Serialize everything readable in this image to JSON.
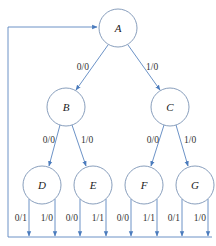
{
  "diagram": {
    "type": "state-transition-tree",
    "colors": {
      "line": "#5b86bf",
      "circle": "#7a93b4",
      "text": "#222222",
      "background": "#ffffff"
    },
    "nodes": [
      {
        "id": "A",
        "label": "A"
      },
      {
        "id": "B",
        "label": "B"
      },
      {
        "id": "C",
        "label": "C"
      },
      {
        "id": "D",
        "label": "D"
      },
      {
        "id": "E",
        "label": "E"
      },
      {
        "id": "F",
        "label": "F"
      },
      {
        "id": "G",
        "label": "G"
      }
    ],
    "edges": [
      {
        "from": "A",
        "to": "B",
        "label": "0/0"
      },
      {
        "from": "A",
        "to": "C",
        "label": "1/0"
      },
      {
        "from": "B",
        "to": "D",
        "label": "0/0"
      },
      {
        "from": "B",
        "to": "E",
        "label": "1/0"
      },
      {
        "from": "C",
        "to": "F",
        "label": "0/0"
      },
      {
        "from": "C",
        "to": "G",
        "label": "1/0"
      }
    ],
    "return_edges": [
      {
        "from": "D",
        "to": "A",
        "label": "0/1"
      },
      {
        "from": "D",
        "to": "A",
        "label": "1/0"
      },
      {
        "from": "E",
        "to": "A",
        "label": "0/0"
      },
      {
        "from": "E",
        "to": "A",
        "label": "1/1"
      },
      {
        "from": "F",
        "to": "A",
        "label": "0/0"
      },
      {
        "from": "F",
        "to": "A",
        "label": "1/1"
      },
      {
        "from": "G",
        "to": "A",
        "label": "0/1"
      },
      {
        "from": "G",
        "to": "A",
        "label": "1/0"
      }
    ]
  }
}
